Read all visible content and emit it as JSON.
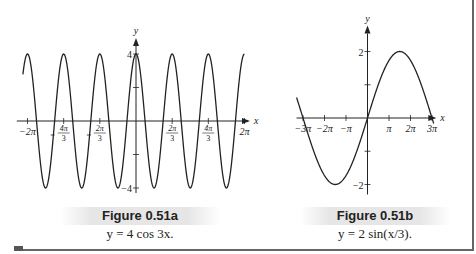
{
  "chart_data": [
    {
      "type": "line",
      "id": "figure-0.51a",
      "title": "Figure 0.51a",
      "equation": "y = 4 cos 3x.",
      "function": "4*cos(3*x)",
      "xlabel": "x",
      "ylabel": "y",
      "xlim": [
        -6.9,
        6.6
      ],
      "ylim": [
        -4.3,
        4.6
      ],
      "x_ticks": [
        {
          "value": -6.2832,
          "label": "−2π"
        },
        {
          "value": -4.1888,
          "label": "−4π/3"
        },
        {
          "value": -2.0944,
          "label": "−2π/3"
        },
        {
          "value": 2.0944,
          "label": "2π/3"
        },
        {
          "value": 4.1888,
          "label": "4π/3"
        },
        {
          "value": 6.2832,
          "label": "2π"
        }
      ],
      "y_ticks": [
        {
          "value": 4,
          "label": "4"
        },
        {
          "value": 2,
          "label": ""
        },
        {
          "value": -2,
          "label": ""
        },
        {
          "value": -4,
          "label": "−4"
        }
      ],
      "grid": false
    },
    {
      "type": "line",
      "id": "figure-0.51b",
      "title": "Figure 0.51b",
      "equation": "y = 2 sin(x/3).",
      "function": "2*sin(x/3)",
      "xlabel": "x",
      "ylabel": "y",
      "xlim": [
        -3.3,
        3.2
      ],
      "ylim": [
        -2.3,
        2.6
      ],
      "x_ticks": [
        {
          "value": -3,
          "label": "−3π"
        },
        {
          "value": -2,
          "label": "−2π"
        },
        {
          "value": -1,
          "label": "−π"
        },
        {
          "value": 1,
          "label": "π"
        },
        {
          "value": 2,
          "label": "2π"
        },
        {
          "value": 3,
          "label": "3π"
        }
      ],
      "x_unit": "π",
      "y_ticks": [
        {
          "value": 2,
          "label": "2"
        },
        {
          "value": 1,
          "label": ""
        },
        {
          "value": -1,
          "label": ""
        },
        {
          "value": -2,
          "label": "−2"
        }
      ],
      "grid": false
    }
  ],
  "captions": {
    "a": {
      "title": "Figure 0.51a",
      "equation": "y = 4 cos 3x."
    },
    "b": {
      "title": "Figure 0.51b",
      "equation": "y = 2 sin(x/3)."
    }
  },
  "axis_labels": {
    "x": "x",
    "y": "y"
  },
  "colors": {
    "curve": "#222222",
    "axis": "#222222",
    "caption_bg": "#e6e6e6",
    "frame": "#666666"
  }
}
